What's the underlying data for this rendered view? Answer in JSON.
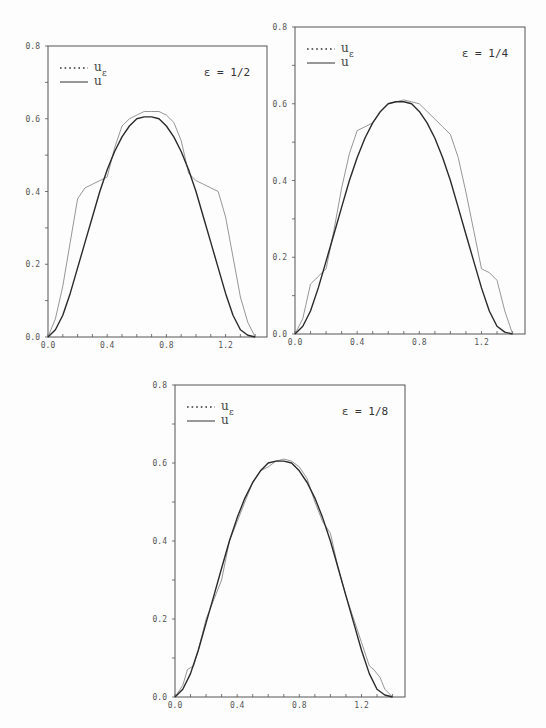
{
  "chart_data": [
    {
      "type": "line",
      "title": "",
      "annotation": "ε = 1/2",
      "xlabel": "",
      "ylabel": "",
      "xlim": [
        0,
        1.48
      ],
      "ylim": [
        0,
        0.8
      ],
      "xticks": [
        "0.0",
        "0.4",
        "0.8",
        "1.2"
      ],
      "yticks": [
        "0.0",
        "0.2",
        "0.4",
        "0.6",
        "0.8"
      ],
      "grid": false,
      "legend": [
        {
          "label": "u",
          "sub": "ε",
          "style": "dotted"
        },
        {
          "label": "u",
          "sub": "",
          "style": "solid"
        }
      ],
      "legend_position": "upper left",
      "box": {
        "x0": 48,
        "y0": 46,
        "x1": 267,
        "y1": 337
      },
      "series": [
        {
          "name": "u_ε",
          "style": "thin",
          "x": [
            0,
            0.05,
            0.1,
            0.15,
            0.2,
            0.25,
            0.3,
            0.35,
            0.4,
            0.45,
            0.5,
            0.55,
            0.6,
            0.65,
            0.7,
            0.75,
            0.8,
            0.85,
            0.9,
            0.95,
            1.0,
            1.05,
            1.1,
            1.15,
            1.2,
            1.25,
            1.3,
            1.35,
            1.4
          ],
          "y": [
            0,
            0.05,
            0.14,
            0.26,
            0.38,
            0.41,
            0.42,
            0.43,
            0.44,
            0.52,
            0.58,
            0.6,
            0.61,
            0.62,
            0.62,
            0.62,
            0.61,
            0.59,
            0.54,
            0.45,
            0.43,
            0.42,
            0.41,
            0.4,
            0.33,
            0.22,
            0.11,
            0.04,
            0
          ]
        },
        {
          "name": "u",
          "style": "solid",
          "x": [
            0,
            0.05,
            0.1,
            0.15,
            0.2,
            0.25,
            0.3,
            0.35,
            0.4,
            0.45,
            0.5,
            0.55,
            0.6,
            0.65,
            0.7,
            0.75,
            0.8,
            0.85,
            0.9,
            0.95,
            1.0,
            1.05,
            1.1,
            1.15,
            1.2,
            1.25,
            1.3,
            1.35,
            1.4
          ],
          "y": [
            0,
            0.02,
            0.06,
            0.12,
            0.19,
            0.26,
            0.33,
            0.4,
            0.46,
            0.51,
            0.55,
            0.58,
            0.6,
            0.605,
            0.605,
            0.6,
            0.58,
            0.55,
            0.51,
            0.46,
            0.4,
            0.33,
            0.26,
            0.19,
            0.12,
            0.06,
            0.02,
            0.005,
            0
          ]
        }
      ]
    },
    {
      "type": "line",
      "title": "",
      "annotation": "ε = 1/4",
      "xlabel": "",
      "ylabel": "",
      "xlim": [
        0,
        1.48
      ],
      "ylim": [
        0,
        0.8
      ],
      "xticks": [
        "0.0",
        "0.4",
        "0.8",
        "1.2"
      ],
      "yticks": [
        "0.0",
        "0.2",
        "0.4",
        "0.6",
        "0.8"
      ],
      "grid": false,
      "legend": [
        {
          "label": "u",
          "sub": "ε",
          "style": "dotted"
        },
        {
          "label": "u",
          "sub": "",
          "style": "solid"
        }
      ],
      "legend_position": "upper left",
      "box": {
        "x0": 295,
        "y0": 27,
        "x1": 525,
        "y1": 334
      },
      "series": [
        {
          "name": "u_ε",
          "style": "thin",
          "x": [
            0,
            0.05,
            0.1,
            0.15,
            0.2,
            0.25,
            0.3,
            0.35,
            0.4,
            0.45,
            0.5,
            0.55,
            0.6,
            0.65,
            0.7,
            0.75,
            0.8,
            0.85,
            0.9,
            0.95,
            1.0,
            1.05,
            1.1,
            1.15,
            1.2,
            1.25,
            1.3,
            1.35,
            1.4
          ],
          "y": [
            0,
            0.04,
            0.13,
            0.15,
            0.17,
            0.27,
            0.38,
            0.47,
            0.53,
            0.54,
            0.55,
            0.58,
            0.6,
            0.605,
            0.61,
            0.605,
            0.6,
            0.58,
            0.56,
            0.54,
            0.52,
            0.46,
            0.37,
            0.27,
            0.17,
            0.16,
            0.14,
            0.06,
            0
          ]
        },
        {
          "name": "u",
          "style": "solid",
          "x": [
            0,
            0.05,
            0.1,
            0.15,
            0.2,
            0.25,
            0.3,
            0.35,
            0.4,
            0.45,
            0.5,
            0.55,
            0.6,
            0.65,
            0.7,
            0.75,
            0.8,
            0.85,
            0.9,
            0.95,
            1.0,
            1.05,
            1.1,
            1.15,
            1.2,
            1.25,
            1.3,
            1.35,
            1.4
          ],
          "y": [
            0,
            0.02,
            0.06,
            0.12,
            0.19,
            0.26,
            0.33,
            0.4,
            0.46,
            0.51,
            0.55,
            0.58,
            0.6,
            0.605,
            0.605,
            0.6,
            0.58,
            0.55,
            0.51,
            0.46,
            0.4,
            0.33,
            0.26,
            0.19,
            0.12,
            0.06,
            0.02,
            0.005,
            0
          ]
        }
      ]
    },
    {
      "type": "line",
      "title": "",
      "annotation": "ε = 1/8",
      "xlabel": "",
      "ylabel": "",
      "xlim": [
        0,
        1.48
      ],
      "ylim": [
        0,
        0.8
      ],
      "xticks": [
        "0.0",
        "0.4",
        "0.8",
        "1.2"
      ],
      "yticks": [
        "0.0",
        "0.2",
        "0.4",
        "0.6",
        "0.8"
      ],
      "grid": false,
      "legend": [
        {
          "label": "u",
          "sub": "ε",
          "style": "dotted"
        },
        {
          "label": "u",
          "sub": "",
          "style": "solid"
        }
      ],
      "legend_position": "upper left",
      "box": {
        "x0": 175,
        "y0": 385,
        "x1": 405,
        "y1": 697
      },
      "series": [
        {
          "name": "u_ε",
          "style": "thin",
          "x": [
            0,
            0.05,
            0.08,
            0.12,
            0.15,
            0.2,
            0.25,
            0.3,
            0.35,
            0.4,
            0.45,
            0.5,
            0.55,
            0.6,
            0.65,
            0.7,
            0.75,
            0.8,
            0.85,
            0.9,
            0.95,
            1.0,
            1.05,
            1.1,
            1.15,
            1.2,
            1.25,
            1.28,
            1.32,
            1.35,
            1.4
          ],
          "y": [
            0,
            0.03,
            0.07,
            0.08,
            0.12,
            0.2,
            0.25,
            0.3,
            0.4,
            0.45,
            0.5,
            0.55,
            0.58,
            0.59,
            0.605,
            0.61,
            0.605,
            0.59,
            0.56,
            0.5,
            0.45,
            0.42,
            0.33,
            0.26,
            0.2,
            0.14,
            0.08,
            0.07,
            0.05,
            0.02,
            0
          ]
        },
        {
          "name": "u",
          "style": "solid",
          "x": [
            0,
            0.05,
            0.1,
            0.15,
            0.2,
            0.25,
            0.3,
            0.35,
            0.4,
            0.45,
            0.5,
            0.55,
            0.6,
            0.65,
            0.7,
            0.75,
            0.8,
            0.85,
            0.9,
            0.95,
            1.0,
            1.05,
            1.1,
            1.15,
            1.2,
            1.25,
            1.3,
            1.35,
            1.4
          ],
          "y": [
            0,
            0.02,
            0.06,
            0.12,
            0.19,
            0.26,
            0.33,
            0.4,
            0.46,
            0.51,
            0.55,
            0.58,
            0.6,
            0.605,
            0.605,
            0.6,
            0.58,
            0.55,
            0.51,
            0.46,
            0.4,
            0.33,
            0.26,
            0.19,
            0.12,
            0.06,
            0.02,
            0.005,
            0
          ]
        }
      ]
    }
  ]
}
